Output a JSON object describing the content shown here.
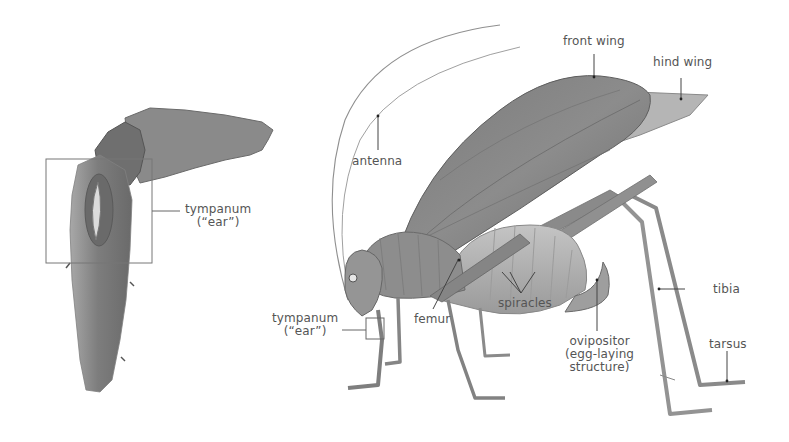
{
  "diagram": {
    "colors": {
      "background": "#ffffff",
      "label_text": "#555555",
      "leader_line": "#444444",
      "body_dark": "#6e6e6e",
      "body_mid": "#8f8f8f",
      "body_light": "#b4b4b4",
      "callout_box": "#777777"
    },
    "inset": {
      "name": "foreleg close-up",
      "labels": {
        "tympanum_line1": "tympanum",
        "tympanum_line2": "(“ear”)"
      }
    },
    "main": {
      "name": "katydid side view",
      "labels": {
        "front_wing": "front wing",
        "hind_wing": "hind wing",
        "antenna": "antenna",
        "tympanum_line1": "tympanum",
        "tympanum_line2": "(“ear”)",
        "femur": "femur",
        "spiracles": "spiracles",
        "ovipositor_line1": "ovipositor",
        "ovipositor_line2": "(egg-laying",
        "ovipositor_line3": "structure)",
        "tibia": "tibia",
        "tarsus": "tarsus"
      }
    }
  }
}
